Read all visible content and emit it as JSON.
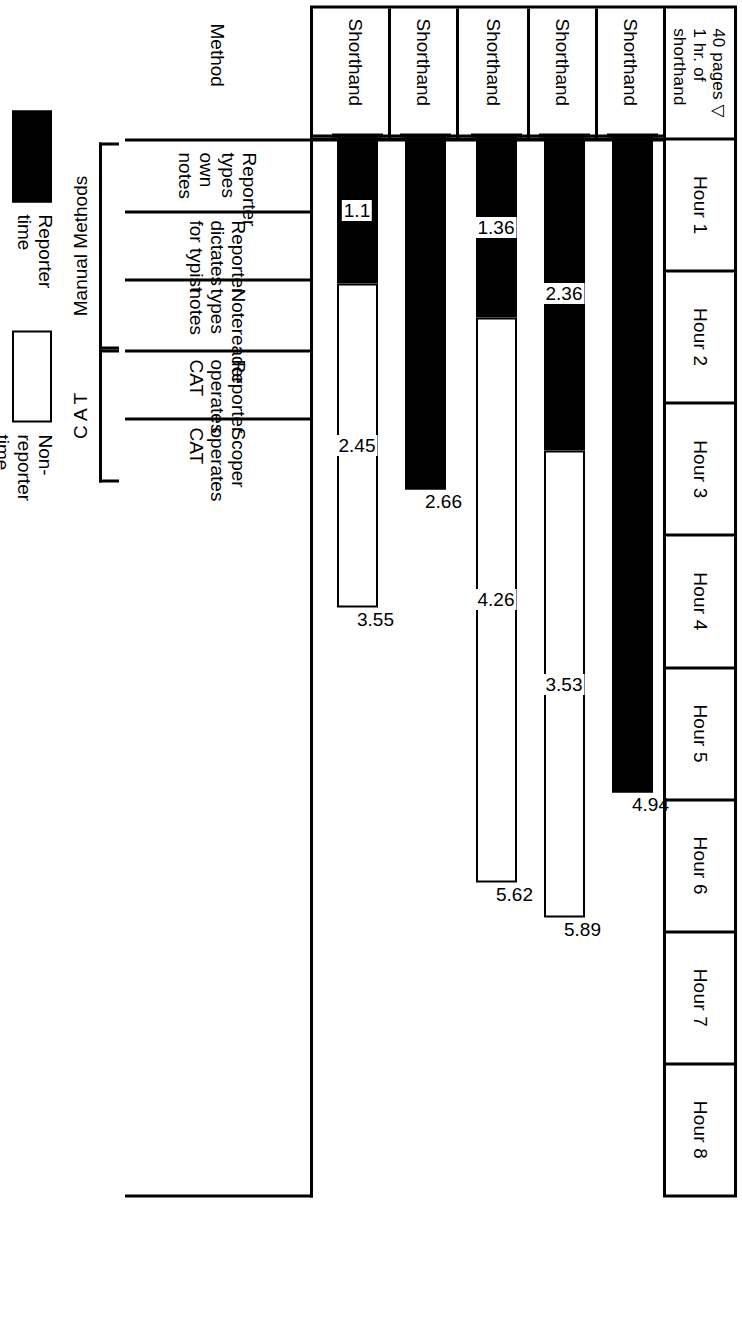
{
  "axis": {
    "title": "Transcription Time",
    "corner_cell": "40 pages ▽\n1 hr. of\nshorthand",
    "hours": [
      "Hour 1",
      "Hour 2",
      "Hour 3",
      "Hour 4",
      "Hour 5",
      "Hour 6",
      "Hour 7",
      "Hour 8"
    ]
  },
  "method_column": {
    "header": "Method",
    "unit_label": "Shorthand"
  },
  "groups": [
    {
      "label": "Manual Methods",
      "rows": [
        0,
        1,
        2
      ]
    },
    {
      "label": "C A T",
      "rows": [
        3,
        4
      ]
    }
  ],
  "legend": {
    "non_reporter": "Non-\nreporter time",
    "reporter": "Reporter\ntime"
  },
  "colors": {
    "reporter": "#000000",
    "non_reporter": "#ffffff",
    "rule": "#000000",
    "background": "#ffffff"
  },
  "chart_data": {
    "type": "bar",
    "orientation": "horizontal-stacked",
    "title": "Transcription Time",
    "xlabel": "Transcription Time",
    "ylabel": "Method",
    "xlim": [
      0,
      8
    ],
    "x_tick_labels": [
      "Hour 1",
      "Hour 2",
      "Hour 3",
      "Hour 4",
      "Hour 5",
      "Hour 6",
      "Hour 7",
      "Hour 8"
    ],
    "grid": false,
    "legend_position": "bottom-right",
    "unit_note": "40 pages ▽ 1 hr. of shorthand",
    "categories": [
      "Reporter\ntypes\nown notes",
      "Reporter\ndictates\nfor typist",
      "Notereader\ntypes\nnotes",
      "Reporter\noperates\nCAT",
      "Scoper\noperates\nCAT"
    ],
    "series": [
      {
        "name": "Reporter time",
        "values": [
          4.94,
          2.36,
          1.36,
          2.66,
          1.1
        ]
      },
      {
        "name": "Non-reporter time",
        "values": [
          0,
          3.53,
          4.26,
          0,
          2.45
        ]
      }
    ],
    "totals": [
      4.94,
      5.89,
      5.62,
      2.66,
      3.55
    ],
    "bars": [
      {
        "category": "Reporter types own notes",
        "reporter": 4.94,
        "non_reporter": 0,
        "total": 4.94,
        "group": "Manual Methods",
        "reporter_label": "",
        "non_reporter_label": "",
        "total_label": "4.94"
      },
      {
        "category": "Reporter dictates for typist",
        "reporter": 2.36,
        "non_reporter": 3.53,
        "total": 5.89,
        "group": "Manual Methods",
        "reporter_label": "2.36",
        "non_reporter_label": "3.53",
        "total_label": "5.89"
      },
      {
        "category": "Notereader types notes",
        "reporter": 1.36,
        "non_reporter": 4.26,
        "total": 5.62,
        "group": "Manual Methods",
        "reporter_label": "1.36",
        "non_reporter_label": "4.26",
        "total_label": "5.62"
      },
      {
        "category": "Reporter operates CAT",
        "reporter": 2.66,
        "non_reporter": 0,
        "total": 2.66,
        "group": "C A T",
        "reporter_label": "",
        "non_reporter_label": "",
        "total_label": "2.66"
      },
      {
        "category": "Scoper operates CAT",
        "reporter": 1.1,
        "non_reporter": 2.45,
        "total": 3.55,
        "group": "C A T",
        "reporter_label": "1.1",
        "non_reporter_label": "2.45",
        "total_label": "3.55"
      }
    ]
  }
}
